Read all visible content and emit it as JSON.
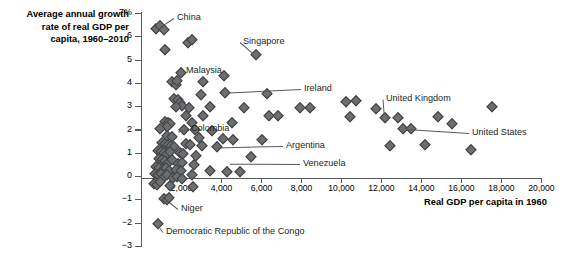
{
  "chart_data": {
    "type": "scatter",
    "title": "",
    "ylabel": "Average annual growth rate of real GDP per capita, 1960–2010",
    "xlabel": "Real GDP per capita in 1960",
    "xlim": [
      0,
      20000
    ],
    "ylim": [
      -3,
      7
    ],
    "xticks": [
      0,
      2000,
      4000,
      6000,
      8000,
      10000,
      12000,
      14000,
      16000,
      18000,
      20000
    ],
    "xticklabels": [
      "",
      "2,000",
      "4,000",
      "6,000",
      "8,000",
      "10,000",
      "12,000",
      "14,000",
      "16,000",
      "18,000",
      "20,000"
    ],
    "yticks": [
      -3,
      -2,
      -1,
      0,
      1,
      2,
      3,
      4,
      5,
      6,
      7
    ],
    "yticklabels": [
      "−3",
      "−2",
      "−1",
      "0",
      "1",
      "2",
      "3",
      "4",
      "5",
      "6",
      "7%"
    ],
    "grid": false,
    "legend": null,
    "marker": "diamond",
    "marker_color": "#6d6e71",
    "points": [
      [
        700,
        6.35
      ],
      [
        900,
        6.45
      ],
      [
        1100,
        6.3
      ],
      [
        2300,
        5.75
      ],
      [
        2500,
        5.85
      ],
      [
        1150,
        5.45
      ],
      [
        5700,
        5.2
      ],
      [
        1950,
        4.45
      ],
      [
        4100,
        4.3
      ],
      [
        1500,
        4.05
      ],
      [
        1700,
        3.95
      ],
      [
        1750,
        4.1
      ],
      [
        3050,
        4.05
      ],
      [
        4150,
        3.6
      ],
      [
        2950,
        3.5
      ],
      [
        6250,
        3.55
      ],
      [
        10200,
        3.2
      ],
      [
        10700,
        3.25
      ],
      [
        17500,
        3.0
      ],
      [
        1600,
        3.35
      ],
      [
        1800,
        3.3
      ],
      [
        1900,
        3.15
      ],
      [
        2000,
        3.05
      ],
      [
        1700,
        3.0
      ],
      [
        3400,
        3.0
      ],
      [
        2350,
        2.95
      ],
      [
        5100,
        2.95
      ],
      [
        11700,
        2.9
      ],
      [
        7900,
        2.95
      ],
      [
        8400,
        2.95
      ],
      [
        2200,
        2.6
      ],
      [
        3050,
        2.6
      ],
      [
        6350,
        2.6
      ],
      [
        6800,
        2.6
      ],
      [
        10400,
        2.55
      ],
      [
        12150,
        2.5
      ],
      [
        12800,
        2.5
      ],
      [
        14800,
        2.55
      ],
      [
        1150,
        2.35
      ],
      [
        1300,
        2.3
      ],
      [
        1400,
        2.25
      ],
      [
        1250,
        2.15
      ],
      [
        2500,
        2.3
      ],
      [
        4500,
        2.3
      ],
      [
        15500,
        2.25
      ],
      [
        900,
        2.05
      ],
      [
        2100,
        2.0
      ],
      [
        2650,
        2.0
      ],
      [
        3500,
        1.95
      ],
      [
        13050,
        2.05
      ],
      [
        13450,
        2.05
      ],
      [
        1250,
        1.75
      ],
      [
        1500,
        1.7
      ],
      [
        2850,
        1.65
      ],
      [
        4050,
        1.6
      ],
      [
        4550,
        1.55
      ],
      [
        6000,
        1.55
      ],
      [
        1000,
        1.45
      ],
      [
        1150,
        1.4
      ],
      [
        1300,
        1.35
      ],
      [
        1450,
        1.3
      ],
      [
        1600,
        1.25
      ],
      [
        2200,
        1.4
      ],
      [
        2400,
        1.35
      ],
      [
        3000,
        1.3
      ],
      [
        3750,
        1.25
      ],
      [
        12400,
        1.3
      ],
      [
        14150,
        1.35
      ],
      [
        16450,
        1.15
      ],
      [
        800,
        1.1
      ],
      [
        950,
        1.05
      ],
      [
        1100,
        1.0
      ],
      [
        1250,
        0.95
      ],
      [
        1400,
        1.05
      ],
      [
        1900,
        1.0
      ],
      [
        2050,
        0.95
      ],
      [
        2700,
        0.9
      ],
      [
        5450,
        0.85
      ],
      [
        850,
        0.75
      ],
      [
        1000,
        0.7
      ],
      [
        1150,
        0.65
      ],
      [
        1300,
        0.6
      ],
      [
        1500,
        0.7
      ],
      [
        1800,
        0.55
      ],
      [
        2000,
        0.6
      ],
      [
        2600,
        0.5
      ],
      [
        700,
        0.4
      ],
      [
        880,
        0.35
      ],
      [
        1050,
        0.3
      ],
      [
        1200,
        0.35
      ],
      [
        1350,
        0.25
      ],
      [
        1700,
        0.3
      ],
      [
        1950,
        0.25
      ],
      [
        3400,
        0.25
      ],
      [
        4250,
        0.2
      ],
      [
        4900,
        0.2
      ],
      [
        650,
        0.1
      ],
      [
        800,
        0.05
      ],
      [
        950,
        0.1
      ],
      [
        1100,
        0.0
      ],
      [
        1280,
        0.05
      ],
      [
        1550,
        -0.05
      ],
      [
        1750,
        0.0
      ],
      [
        2000,
        -0.1
      ],
      [
        2500,
        0.05
      ],
      [
        600,
        -0.3
      ],
      [
        780,
        -0.35
      ],
      [
        900,
        -0.25
      ],
      [
        1400,
        -0.4
      ],
      [
        2550,
        -0.45
      ],
      [
        1100,
        -0.95
      ],
      [
        1250,
        -1.0
      ],
      [
        1350,
        -0.9
      ],
      [
        800,
        -2.05
      ]
    ],
    "annotations": [
      {
        "label": "China",
        "x": 900,
        "y": 6.4
      },
      {
        "label": "Singapore",
        "x": 5700,
        "y": 5.2
      },
      {
        "label": "Malaysia",
        "x": 1950,
        "y": 4.45
      },
      {
        "label": "Ireland",
        "x": 4150,
        "y": 3.6
      },
      {
        "label": "United Kingdom",
        "x": 12150,
        "y": 2.5
      },
      {
        "label": "United States",
        "x": 13050,
        "y": 2.05
      },
      {
        "label": "Colombia",
        "x": 1650,
        "y": 1.9
      },
      {
        "label": "Argentina",
        "x": 3650,
        "y": 1.25
      },
      {
        "label": "Venezuela",
        "x": 4250,
        "y": 0.55
      },
      {
        "label": "Niger",
        "x": 1250,
        "y": -1.0
      },
      {
        "label": "Democratic Republic of the Congo",
        "x": 800,
        "y": -2.05
      }
    ]
  },
  "labels": {
    "ytitle": "Average annual growth\nrate of real GDP per\ncapita, 1960–2010",
    "xtitle": "Real GDP per capita in 1960"
  }
}
